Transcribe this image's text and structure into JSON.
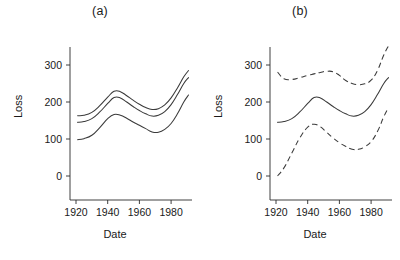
{
  "figure": {
    "width": 400,
    "height": 260,
    "background": "#ffffff",
    "ink_color": "#3a3a3a"
  },
  "panels": [
    {
      "id": "a",
      "title": "(a)",
      "xlabel": "Date",
      "ylabel": "Loss"
    },
    {
      "id": "b",
      "title": "(b)",
      "xlabel": "Date",
      "ylabel": "Loss"
    }
  ],
  "axes": {
    "x_ticks": [
      1920,
      1940,
      1960,
      1980
    ],
    "x_tick_labels": [
      "1920",
      "1940",
      "1960",
      "1980"
    ],
    "y_ticks": [
      0,
      100,
      200,
      300
    ],
    "y_tick_labels": [
      "0",
      "100",
      "200",
      "300"
    ],
    "xlim": [
      1916,
      1993
    ],
    "ylim": [
      -55,
      360
    ]
  },
  "chart_data": [
    {
      "type": "line",
      "title": "(a)",
      "xlabel": "Date",
      "ylabel": "Loss",
      "xlim": [
        1916,
        1993
      ],
      "ylim": [
        -55,
        360
      ],
      "xticks": [
        1920,
        1940,
        1960,
        1980
      ],
      "yticks": [
        0,
        100,
        200,
        300
      ],
      "grid": false,
      "legend": "none",
      "x": [
        1921,
        1925,
        1930,
        1935,
        1940,
        1944,
        1948,
        1952,
        1956,
        1960,
        1964,
        1968,
        1972,
        1976,
        1980,
        1984,
        1988,
        1991
      ],
      "series": [
        {
          "name": "upper confidence bound",
          "style": "solid",
          "values": [
            163,
            164,
            172,
            190,
            213,
            229,
            228,
            217,
            205,
            194,
            185,
            180,
            182,
            192,
            211,
            238,
            268,
            285
          ]
        },
        {
          "name": "fitted mean",
          "style": "solid",
          "values": [
            145,
            147,
            155,
            173,
            196,
            212,
            211,
            200,
            188,
            177,
            168,
            162,
            164,
            174,
            193,
            220,
            250,
            266
          ]
        },
        {
          "name": "lower confidence bound",
          "style": "solid",
          "values": [
            98,
            101,
            110,
            131,
            155,
            166,
            164,
            156,
            146,
            137,
            128,
            119,
            118,
            126,
            142,
            168,
            200,
            219
          ]
        }
      ]
    },
    {
      "type": "line",
      "title": "(b)",
      "xlabel": "Date",
      "ylabel": "Loss",
      "xlim": [
        1916,
        1993
      ],
      "ylim": [
        -55,
        360
      ],
      "xticks": [
        1920,
        1940,
        1960,
        1980
      ],
      "yticks": [
        0,
        100,
        200,
        300
      ],
      "grid": false,
      "legend": "none",
      "x": [
        1921,
        1925,
        1930,
        1935,
        1940,
        1944,
        1948,
        1952,
        1956,
        1960,
        1964,
        1968,
        1972,
        1976,
        1980,
        1984,
        1988,
        1991
      ],
      "series": [
        {
          "name": "upper prediction bound",
          "style": "dashed",
          "values": [
            281,
            263,
            261,
            266,
            272,
            276,
            280,
            283,
            282,
            272,
            258,
            250,
            247,
            249,
            259,
            285,
            327,
            352
          ]
        },
        {
          "name": "fitted mean",
          "style": "solid",
          "values": [
            145,
            147,
            155,
            173,
            196,
            212,
            211,
            200,
            188,
            177,
            168,
            162,
            164,
            174,
            193,
            220,
            250,
            266
          ]
        },
        {
          "name": "lower prediction bound",
          "style": "dashed",
          "values": [
            0,
            22,
            62,
            103,
            132,
            140,
            133,
            118,
            103,
            90,
            80,
            72,
            72,
            79,
            93,
            120,
            160,
            185
          ]
        }
      ]
    }
  ]
}
